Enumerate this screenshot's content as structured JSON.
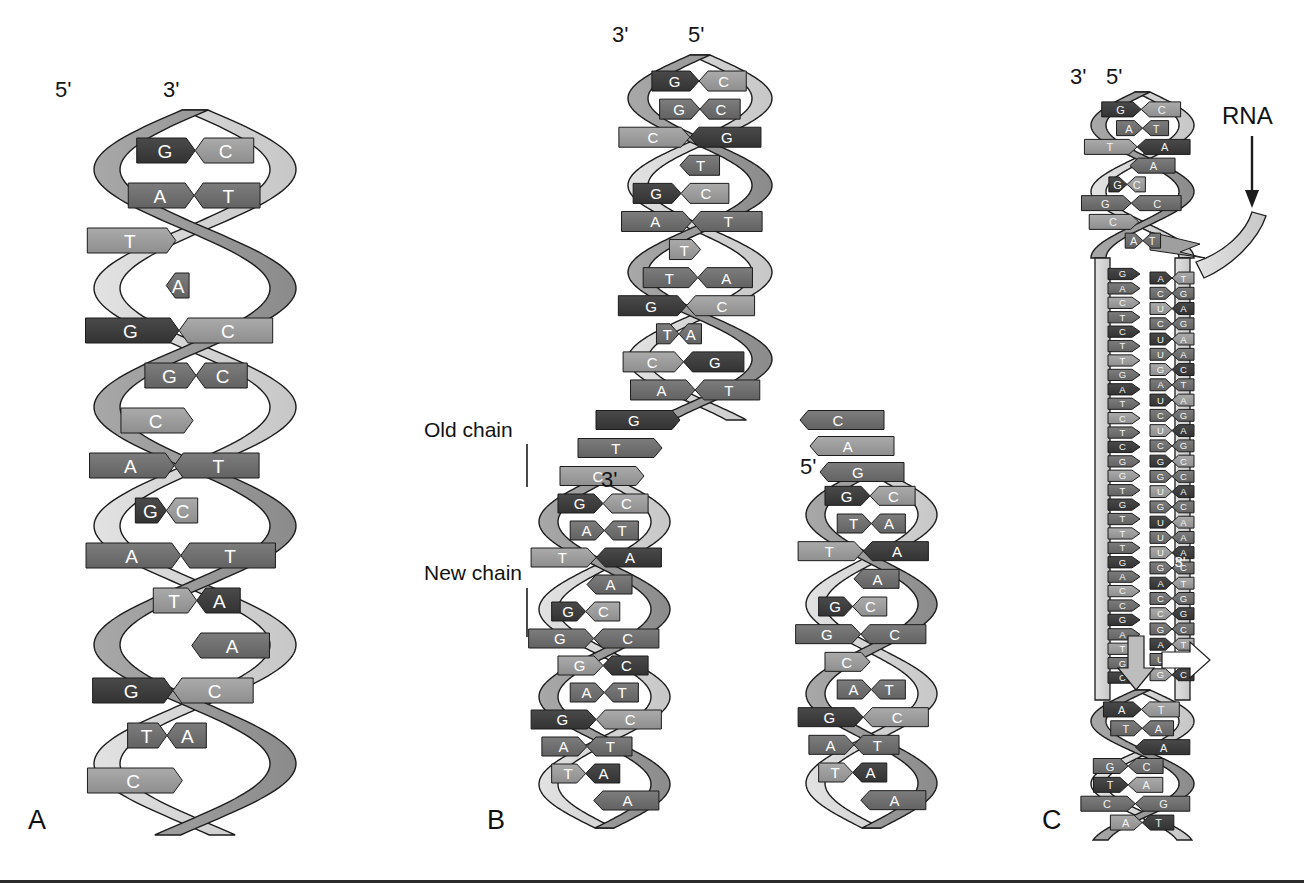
{
  "figure": {
    "background_color": "#ffffff",
    "panels": [
      "A",
      "B",
      "C"
    ]
  },
  "palette": {
    "backbone_light": "#d9d9d9",
    "backbone_mid": "#9a9a9a",
    "base_dark": "#3d3d3d",
    "base_mid": "#6e6e6e",
    "base_light": "#9f9f9f",
    "base_pale": "#c0c0c0",
    "outline": "#1c1c1c",
    "text_on_base": "#ffffff",
    "label_text": "#121212"
  },
  "panel_a": {
    "letter": "A",
    "end_labels": {
      "left": "5'",
      "right": "3'"
    },
    "base_pairs": [
      {
        "left": "G",
        "right": "C"
      },
      {
        "left": "A",
        "right": "T"
      },
      {
        "left": "T",
        "right": ""
      },
      {
        "left": "",
        "right": "A"
      },
      {
        "left": "G",
        "right": "C"
      },
      {
        "left": "G",
        "right": "C"
      },
      {
        "left": "C",
        "right": ""
      },
      {
        "left": "A",
        "right": "T"
      },
      {
        "left": "G",
        "right": "C"
      },
      {
        "left": "A",
        "right": "T"
      },
      {
        "left": "T",
        "right": "A"
      },
      {
        "left": "",
        "right": "A"
      },
      {
        "left": "G",
        "right": "C"
      },
      {
        "left": "T",
        "right": "A"
      },
      {
        "left": "C",
        "right": ""
      }
    ]
  },
  "panel_b": {
    "letter": "B",
    "end_labels": {
      "left": "3'",
      "right": "5'"
    },
    "callouts": [
      {
        "text": "Old chain"
      },
      {
        "text": "New chain"
      }
    ],
    "fork_labels": {
      "left_branch": "3'",
      "right_branch": "5'"
    },
    "parent_base_pairs": [
      {
        "left": "G",
        "right": "C"
      },
      {
        "left": "G",
        "right": "C"
      },
      {
        "left": "C",
        "right": "G"
      },
      {
        "left": "",
        "right": "T"
      },
      {
        "left": "G",
        "right": "C"
      },
      {
        "left": "A",
        "right": "T"
      },
      {
        "left": "T",
        "right": ""
      },
      {
        "left": "T",
        "right": "A"
      },
      {
        "left": "G",
        "right": "C"
      },
      {
        "left": "T",
        "right": "A"
      },
      {
        "left": "C",
        "right": "G"
      },
      {
        "left": "A",
        "right": "T"
      }
    ],
    "fork_unpaired_left": [
      "G",
      "T",
      "C"
    ],
    "fork_unpaired_right": [
      "C",
      "A",
      "G"
    ],
    "left_branch_base_pairs": [
      {
        "left": "G",
        "right": "C"
      },
      {
        "left": "A",
        "right": "T"
      },
      {
        "left": "T",
        "right": "A"
      },
      {
        "left": "",
        "right": "A"
      },
      {
        "left": "G",
        "right": "C"
      },
      {
        "left": "G",
        "right": "C"
      },
      {
        "left": "G",
        "right": "C"
      },
      {
        "left": "A",
        "right": "T"
      },
      {
        "left": "G",
        "right": "C"
      },
      {
        "left": "A",
        "right": "T"
      },
      {
        "left": "T",
        "right": "A"
      },
      {
        "left": "",
        "right": "A"
      }
    ],
    "right_branch_base_pairs": [
      {
        "left": "G",
        "right": "C"
      },
      {
        "left": "T",
        "right": "A"
      },
      {
        "left": "T",
        "right": "A"
      },
      {
        "left": "",
        "right": "A"
      },
      {
        "left": "G",
        "right": "C"
      },
      {
        "left": "G",
        "right": "C"
      },
      {
        "left": "C",
        "right": ""
      },
      {
        "left": "A",
        "right": "T"
      },
      {
        "left": "G",
        "right": "C"
      },
      {
        "left": "A",
        "right": "T"
      },
      {
        "left": "T",
        "right": "A"
      },
      {
        "left": "",
        "right": "A"
      }
    ]
  },
  "panel_c": {
    "letter": "C",
    "end_labels": {
      "left": "3'",
      "right": "5'"
    },
    "rna_label": "RNA",
    "rna_three_prime": "3'",
    "top_base_pairs": [
      {
        "left": "G",
        "right": "C"
      },
      {
        "left": "A",
        "right": "T"
      },
      {
        "left": "T",
        "right": "A"
      },
      {
        "left": "",
        "right": "A"
      },
      {
        "left": "G",
        "right": "C"
      },
      {
        "left": "G",
        "right": "C"
      },
      {
        "left": "C",
        "right": ""
      },
      {
        "left": "A",
        "right": "T"
      }
    ],
    "template_strand": [
      "G",
      "A",
      "C",
      "T",
      "C",
      "T",
      "T",
      "G",
      "A",
      "T",
      "C",
      "T",
      "C",
      "G",
      "G",
      "T",
      "G",
      "T",
      "T",
      "T",
      "G",
      "A",
      "C",
      "C",
      "G",
      "A",
      "T",
      "G",
      "C"
    ],
    "rna_hybrid": [
      {
        "dna": "A",
        "rna": "T"
      },
      {
        "dna": "C",
        "rna": "G"
      },
      {
        "dna": "U",
        "rna": "A"
      },
      {
        "dna": "C",
        "rna": "G"
      },
      {
        "dna": "U",
        "rna": "A"
      },
      {
        "dna": "U",
        "rna": "A"
      },
      {
        "dna": "G",
        "rna": "C"
      },
      {
        "dna": "A",
        "rna": "T"
      },
      {
        "dna": "U",
        "rna": "A"
      },
      {
        "dna": "C",
        "rna": "G"
      },
      {
        "dna": "U",
        "rna": "A"
      },
      {
        "dna": "C",
        "rna": "G"
      },
      {
        "dna": "G",
        "rna": "C"
      },
      {
        "dna": "G",
        "rna": "C"
      },
      {
        "dna": "U",
        "rna": "A"
      },
      {
        "dna": "G",
        "rna": "C"
      },
      {
        "dna": "U",
        "rna": "A"
      },
      {
        "dna": "U",
        "rna": "A"
      },
      {
        "dna": "U",
        "rna": "A"
      },
      {
        "dna": "G",
        "rna": "C"
      },
      {
        "dna": "A",
        "rna": "T"
      },
      {
        "dna": "C",
        "rna": "G"
      },
      {
        "dna": "C",
        "rna": "G"
      },
      {
        "dna": "G",
        "rna": "C"
      },
      {
        "dna": "A",
        "rna": "T"
      },
      {
        "dna": "U",
        "rna": "A"
      },
      {
        "dna": "G",
        "rna": "C"
      }
    ],
    "bottom_base_pairs": [
      {
        "left": "A",
        "right": "T"
      },
      {
        "left": "T",
        "right": "A"
      },
      {
        "left": "",
        "right": "A"
      },
      {
        "left": "G",
        "right": "C"
      },
      {
        "left": "T",
        "right": "A"
      },
      {
        "left": "C",
        "right": "G"
      },
      {
        "left": "A",
        "right": "T"
      }
    ]
  }
}
